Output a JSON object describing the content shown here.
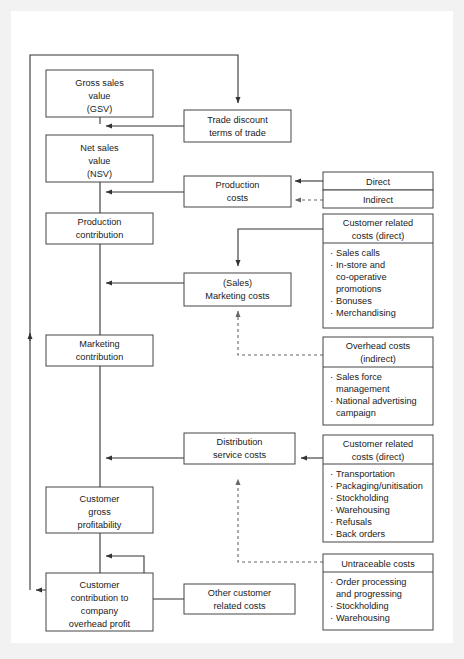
{
  "diagram": {
    "colors": {
      "page_background": "#f2f2f2",
      "canvas_background": "#ffffff",
      "box_stroke": "#444444",
      "line": "#333333",
      "dashed_line": "#666666",
      "text": "#1a1a1a"
    },
    "nodes": {
      "gross_sales_value": {
        "lines": [
          "Gross sales",
          "value",
          "(GSV)"
        ]
      },
      "net_sales_value": {
        "lines": [
          "Net sales",
          "value",
          "(NSV)"
        ]
      },
      "production_contribution": {
        "lines": [
          "Production",
          "contribution"
        ]
      },
      "marketing_contribution": {
        "lines": [
          "Marketing",
          "contribution"
        ]
      },
      "customer_gross_profitability": {
        "lines": [
          "Customer",
          "gross",
          "profitability"
        ]
      },
      "customer_contribution": {
        "lines": [
          "Customer",
          "contribution to",
          "company",
          "overhead profit"
        ]
      },
      "trade_discount": {
        "lines": [
          "Trade discount",
          "terms of trade"
        ]
      },
      "production_costs": {
        "lines": [
          "Production",
          "costs"
        ]
      },
      "sales_marketing_costs": {
        "lines": [
          "(Sales)",
          "Marketing costs"
        ]
      },
      "distribution_service_costs": {
        "lines": [
          "Distribution",
          "service costs"
        ]
      },
      "other_customer_related_costs": {
        "lines": [
          "Other customer",
          "related costs"
        ]
      },
      "direct": {
        "lines": [
          "Direct"
        ]
      },
      "indirect": {
        "lines": [
          "Indirect"
        ]
      }
    },
    "panels": {
      "customer_related_direct_marketing": {
        "header": [
          "Customer related",
          "costs (direct)"
        ],
        "bullets": [
          [
            "Sales calls"
          ],
          [
            "In-store and",
            "co-operative",
            "promotions"
          ],
          [
            "Bonuses"
          ],
          [
            "Merchandising"
          ]
        ]
      },
      "overhead_indirect": {
        "header": [
          "Overhead costs",
          "(indirect)"
        ],
        "bullets": [
          [
            "Sales force",
            "management"
          ],
          [
            "National advertising",
            "campaign"
          ]
        ]
      },
      "customer_related_direct_distribution": {
        "header": [
          "Customer related",
          "costs (direct)"
        ],
        "bullets": [
          [
            "Transportation"
          ],
          [
            "Packaging/unitisation"
          ],
          [
            "Stockholding"
          ],
          [
            "Warehousing"
          ],
          [
            "Refusals"
          ],
          [
            "Back orders"
          ]
        ]
      },
      "untraceable": {
        "header": [
          "Untraceable costs"
        ],
        "bullets": [
          [
            "Order processing",
            "and progressing"
          ],
          [
            "Stockholding"
          ],
          [
            "Warehousing"
          ]
        ]
      }
    },
    "bullet_glyph": "·"
  }
}
